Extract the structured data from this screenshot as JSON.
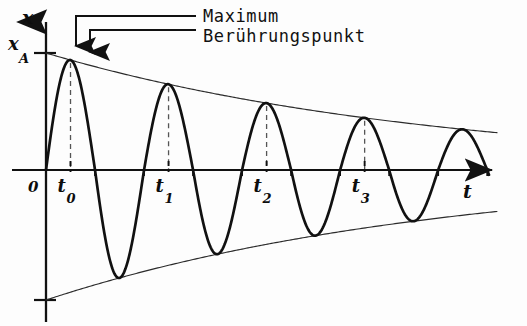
{
  "figure": {
    "background_color": "#fdfdfd",
    "ink_color": "#111111"
  },
  "axes": {
    "y_label": "x",
    "x_label": "t",
    "origin_label": "0",
    "amplitude_label": "x",
    "amplitude_sub": "A"
  },
  "annotations": [
    {
      "id": "maximum",
      "label": "Maximum"
    },
    {
      "id": "beruehrungspunkt",
      "label": "Berührungspunkt"
    }
  ],
  "tick_labels": [
    {
      "base": "t",
      "sub": "0"
    },
    {
      "base": "t",
      "sub": "1"
    },
    {
      "base": "t",
      "sub": "2"
    },
    {
      "base": "t",
      "sub": "3"
    }
  ],
  "chart_data": {
    "type": "line",
    "xlabel": "t",
    "ylabel": "x",
    "grid": false,
    "legend": "none",
    "xlim": [
      0,
      4.6
    ],
    "ylim": [
      -1.05,
      1.05
    ],
    "parameters": {
      "x_A": 1.0,
      "decay_per_period": 0.78,
      "periods_shown": 4.6,
      "quarter_period_offset": 0.25
    },
    "maxima": [
      {
        "label": "t0",
        "t": 0.25,
        "x": 0.96
      },
      {
        "label": "t1",
        "t": 1.25,
        "x": 0.72
      },
      {
        "label": "t2",
        "t": 2.25,
        "x": 0.55
      },
      {
        "label": "t3",
        "t": 3.25,
        "x": 0.41
      }
    ],
    "minima": [
      {
        "t": 0.75,
        "x": -0.84
      },
      {
        "t": 1.75,
        "x": -0.63
      },
      {
        "t": 2.75,
        "x": -0.48
      },
      {
        "t": 3.75,
        "x": -0.36
      }
    ],
    "zero_crossings": [
      0.0,
      0.5,
      1.0,
      1.5,
      2.0,
      2.5,
      3.0,
      3.5,
      4.0,
      4.5
    ],
    "series": [
      {
        "name": "x(t)",
        "role": "oscillation",
        "stroke": "#111111",
        "width": 2.6
      },
      {
        "name": "upper envelope",
        "role": "envelope",
        "stroke": "#2b2b2b",
        "width": 1.0
      },
      {
        "name": "lower envelope",
        "role": "envelope",
        "stroke": "#2b2b2b",
        "width": 1.0
      }
    ]
  },
  "geometry": {
    "axis_y": 170,
    "axis_x": 46,
    "x_axis_end": 497,
    "y_axis_top": 10,
    "y_axis_bottom": 322,
    "amplitude_tick_y": 53,
    "lower_tick_y": 300,
    "peaks_px": [
      {
        "x": 73,
        "y": 60
      },
      {
        "x": 178,
        "y": 94
      },
      {
        "x": 283,
        "y": 121
      },
      {
        "x": 389,
        "y": 139
      }
    ]
  }
}
